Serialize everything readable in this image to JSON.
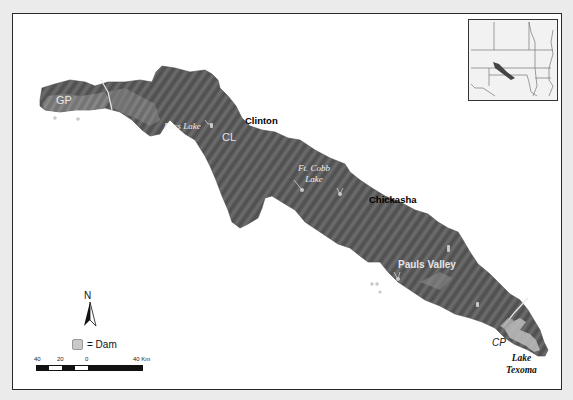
{
  "map": {
    "type": "watershed shaded-relief map",
    "colors": {
      "background": "#ebebeb",
      "frame_fill": "#ffffff",
      "watershed_fill": "#585858",
      "watershed_light": "#7a7a7a",
      "dam_marker": "#c9c9c9",
      "boundary_line": "#e8e8e8"
    },
    "regions": [
      {
        "id": "gp",
        "label": "GP"
      },
      {
        "id": "cl",
        "label": "CL"
      },
      {
        "id": "cp",
        "label": "CP"
      }
    ],
    "cities": [
      {
        "id": "clinton",
        "label": "Clinton"
      },
      {
        "id": "chickasha",
        "label": "Chickasha"
      },
      {
        "id": "pauls-valley",
        "label": "Pauls Valley"
      }
    ],
    "lakes": [
      {
        "id": "foss-lake",
        "label": "Foss Lake"
      },
      {
        "id": "ft-cobb-lake",
        "label_line1": "Ft. Cobb",
        "label_line2": "Lake"
      },
      {
        "id": "lake-texoma",
        "label_line1": "Lake",
        "label_line2": "Texoma"
      }
    ]
  },
  "legend": {
    "north_label": "N",
    "dam_label": "= Dam",
    "scale": {
      "ticks": [
        "40",
        "20",
        "0",
        "40 Km"
      ]
    }
  },
  "inset": {
    "description": "locator map of south-central United States with watershed highlighted"
  }
}
